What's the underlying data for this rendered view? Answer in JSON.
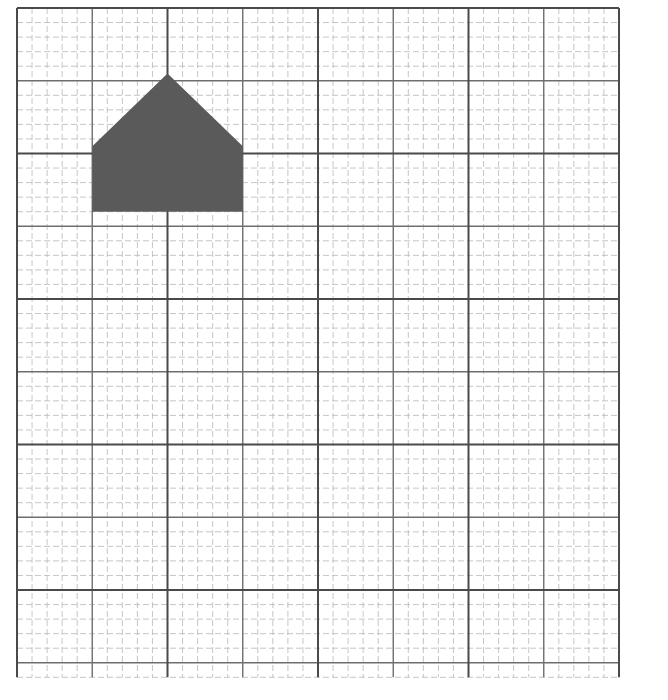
{
  "figure": {
    "grid": {
      "origin_x": 17,
      "origin_y": 8,
      "cell_w": 15.05,
      "cell_h": 14.55,
      "cols": 40,
      "rows": 46,
      "medium_every": 5,
      "major_every": 10,
      "minor_color": "#b8b8b8",
      "medium_color": "#6e6e6e",
      "major_color": "#4a4a4a"
    },
    "shape": {
      "name": "pentagon",
      "fill": "#5a5a5a",
      "vertices_cells": [
        [
          5,
          14
        ],
        [
          5,
          9.5
        ],
        [
          10,
          4.5
        ],
        [
          15,
          9.5
        ],
        [
          15,
          14
        ]
      ]
    }
  }
}
